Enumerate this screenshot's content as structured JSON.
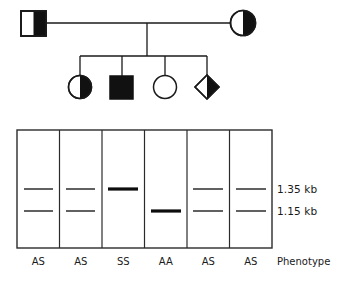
{
  "figure": {
    "kind": "genetics-pedigree-with-gel",
    "pedigree": {
      "generation_1": [
        {
          "id": "father",
          "shape": "square",
          "fill": "half-right",
          "role": "father"
        },
        {
          "id": "mother",
          "shape": "circle",
          "fill": "half-right",
          "role": "mother"
        }
      ],
      "generation_2": [
        {
          "id": "child-1",
          "shape": "circle",
          "fill": "half-right",
          "role": "daughter"
        },
        {
          "id": "child-2",
          "shape": "square",
          "fill": "full",
          "role": "son"
        },
        {
          "id": "child-3",
          "shape": "circle",
          "fill": "none",
          "role": "daughter"
        },
        {
          "id": "child-4",
          "shape": "diamond",
          "fill": "half-right",
          "role": "unknown-sex"
        }
      ]
    },
    "gel": {
      "lane_count": 6,
      "size_markers": [
        {
          "label": "1.35 kb",
          "band": "upper"
        },
        {
          "label": "1.15 kb",
          "band": "lower"
        }
      ],
      "phenotype_title": "Phenotype",
      "lanes": [
        {
          "index": 1,
          "phenotype": "AS",
          "upper_band": true,
          "lower_band": true,
          "upper_weight": "thin",
          "lower_weight": "thin"
        },
        {
          "index": 2,
          "phenotype": "AS",
          "upper_band": true,
          "lower_band": true,
          "upper_weight": "thin",
          "lower_weight": "thin"
        },
        {
          "index": 3,
          "phenotype": "SS",
          "upper_band": true,
          "lower_band": false,
          "upper_weight": "thick",
          "lower_weight": "none"
        },
        {
          "index": 4,
          "phenotype": "AA",
          "upper_band": false,
          "lower_band": true,
          "upper_weight": "none",
          "lower_weight": "thick"
        },
        {
          "index": 5,
          "phenotype": "AS",
          "upper_band": true,
          "lower_band": true,
          "upper_weight": "thin",
          "lower_weight": "thin"
        },
        {
          "index": 6,
          "phenotype": "AS",
          "upper_band": true,
          "lower_band": true,
          "upper_weight": "thin",
          "lower_weight": "thin"
        }
      ]
    },
    "colors": {
      "ink": "#1a1a1a",
      "band_thin": "#595959",
      "band_thick": "#0d0d0d",
      "background": "#ffffff"
    }
  }
}
